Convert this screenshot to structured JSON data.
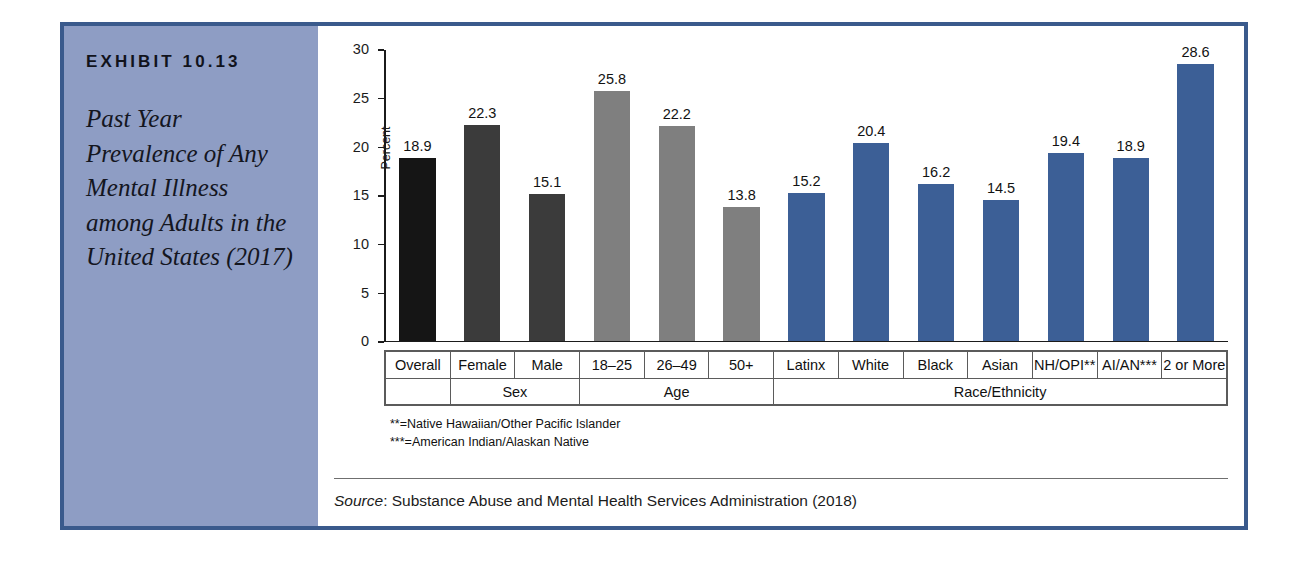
{
  "exhibit": {
    "number": "EXHIBIT 10.13",
    "title": "Past Year Prevalence of Any Mental Illness among Adults in the United States (2017)"
  },
  "chart_data": {
    "type": "bar",
    "title": "Past Year Prevalence of Any Mental Illness among Adults in the United States (2017)",
    "xlabel": "",
    "ylabel": "Percent",
    "ylim": [
      0,
      30
    ],
    "yticks": [
      0,
      5,
      10,
      15,
      20,
      25,
      30
    ],
    "ytick_labels": [
      "0",
      "5",
      "10",
      "15",
      "20",
      "25",
      "30"
    ],
    "grid": false,
    "legend": "none",
    "categories": [
      "Overall",
      "Female",
      "Male",
      "18–25",
      "26–49",
      "50+",
      "Latinx",
      "White",
      "Black",
      "Asian",
      "NH/OPI**",
      "AI/AN***",
      "2 or More"
    ],
    "values": [
      18.9,
      22.3,
      15.1,
      25.8,
      22.2,
      13.8,
      15.2,
      20.4,
      16.2,
      14.5,
      19.4,
      18.9,
      28.6
    ],
    "value_labels": [
      "18.9",
      "22.3",
      "15.1",
      "25.8",
      "22.2",
      "13.8",
      "15.2",
      "20.4",
      "16.2",
      "14.5",
      "19.4",
      "18.9",
      "28.6"
    ],
    "bar_colors": [
      "#151515",
      "#3b3b3b",
      "#3b3b3b",
      "#7f7f7f",
      "#7f7f7f",
      "#7f7f7f",
      "#3c5f96",
      "#3c5f96",
      "#3c5f96",
      "#3c5f96",
      "#3c5f96",
      "#3c5f96",
      "#3c5f96"
    ],
    "groups": [
      {
        "label": "",
        "span": 1
      },
      {
        "label": "Sex",
        "span": 2
      },
      {
        "label": "Age",
        "span": 3
      },
      {
        "label": "Race/Ethnicity",
        "span": 7
      }
    ]
  },
  "footnotes": [
    "**=Native Hawaiian/Other Pacific Islander",
    "***=American Indian/Alaskan Native"
  ],
  "source": {
    "label": "Source",
    "text": ": Substance Abuse and Mental Health Services Administration (2018)"
  },
  "colors": {
    "panel_background": "#8e9dc4",
    "frame_border": "#3a5a8c",
    "blue_bar": "#3c5f96",
    "gray_bar": "#7f7f7f",
    "dark_gray_bar": "#3b3b3b",
    "black_bar": "#151515"
  }
}
